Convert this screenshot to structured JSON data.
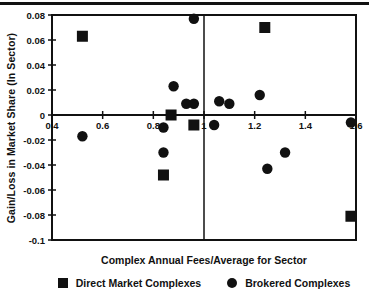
{
  "chart_data": {
    "type": "scatter",
    "title": "",
    "xlabel": "Complex Annual Fees/Average for Sector",
    "ylabel": "Gain/Loss in Market Share (In Sector)",
    "xlim": [
      0.4,
      1.6
    ],
    "ylim": [
      -0.1,
      0.08
    ],
    "x_ticks": [
      0.4,
      0.6,
      0.8,
      1,
      1.2,
      1.4,
      1.6
    ],
    "x_tick_labels": [
      "0.4",
      "0.6",
      "0.8",
      "1",
      "1.2",
      "1.4",
      "1.6"
    ],
    "y_ticks": [
      0.08,
      0.06,
      0.04,
      0.02,
      0,
      -0.02,
      -0.04,
      -0.06,
      -0.08,
      -0.1
    ],
    "y_tick_labels": [
      "0.08",
      "0.06",
      "0.04",
      "0.02",
      "0",
      "-0.02",
      "-0.04",
      "-0.06",
      "-0.08",
      "-0.1"
    ],
    "grid": false,
    "legend_position": "bottom",
    "marker_color": "#111111",
    "reference_lines": {
      "vertical_x": 1,
      "horizontal_y": 0
    },
    "series": [
      {
        "name": "Direct Market Complexes",
        "marker": "square",
        "points": [
          [
            0.52,
            0.063
          ],
          [
            1.24,
            0.07
          ],
          [
            0.87,
            0.0
          ],
          [
            0.96,
            -0.008
          ],
          [
            0.84,
            -0.048
          ],
          [
            1.58,
            -0.081
          ]
        ]
      },
      {
        "name": "Brokered Complexes",
        "marker": "circle",
        "points": [
          [
            0.96,
            0.077
          ],
          [
            0.88,
            0.023
          ],
          [
            0.93,
            0.009
          ],
          [
            0.96,
            0.009
          ],
          [
            1.06,
            0.011
          ],
          [
            1.1,
            0.009
          ],
          [
            1.22,
            0.016
          ],
          [
            1.04,
            -0.008
          ],
          [
            0.84,
            -0.01
          ],
          [
            0.52,
            -0.017
          ],
          [
            0.84,
            -0.03
          ],
          [
            1.32,
            -0.03
          ],
          [
            1.25,
            -0.043
          ],
          [
            1.58,
            -0.006
          ]
        ]
      }
    ]
  }
}
